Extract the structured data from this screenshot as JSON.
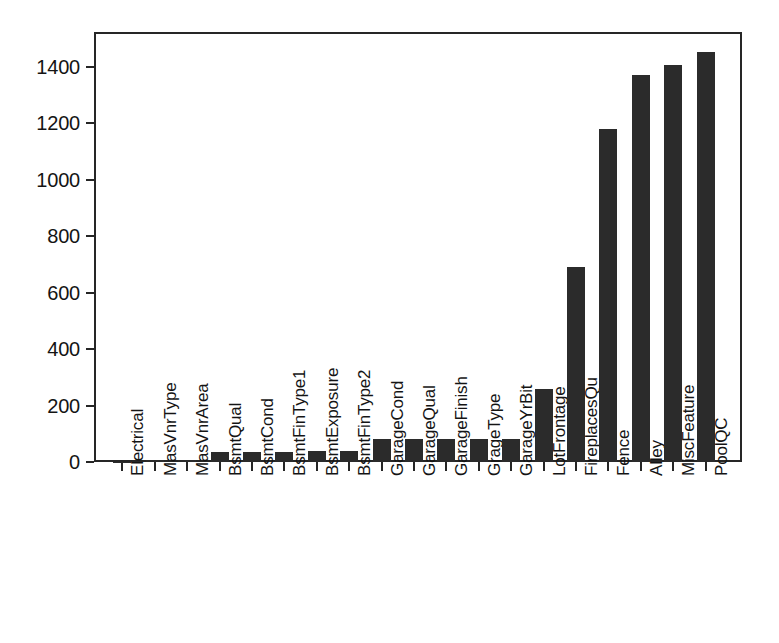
{
  "chart_data": {
    "type": "bar",
    "title": "",
    "subtitle": "",
    "xlabel": "",
    "ylabel": "",
    "grid": false,
    "legend": "none",
    "ylim": [
      0,
      1460
    ],
    "yticks": [
      0,
      200,
      400,
      600,
      800,
      1000,
      1200,
      1400
    ],
    "ytick_labels": [
      "0",
      "200",
      "400",
      "600",
      "800",
      "1000",
      "1200",
      "1400"
    ],
    "bar_color": "#2b2b2b",
    "axis_color": "#262626",
    "background": "#ffffff",
    "categories": [
      "Electrical",
      "MasVnrType",
      "MasVnrArea",
      "BsmtQual",
      "BsmtCond",
      "BsmtFinType1",
      "BsmtExposure",
      "BsmtFinType2",
      "GarageCond",
      "GarageQual",
      "GarageFinish",
      "GrageType",
      "GarageYrBit",
      "LotFrontage",
      "FireplacesQu",
      "Fence",
      "Alley",
      "MiscFeature",
      "PoolQC"
    ],
    "values": [
      1,
      8,
      8,
      37,
      37,
      37,
      38,
      38,
      81,
      81,
      81,
      81,
      81,
      259,
      690,
      1179,
      1369,
      1406,
      1453
    ]
  }
}
